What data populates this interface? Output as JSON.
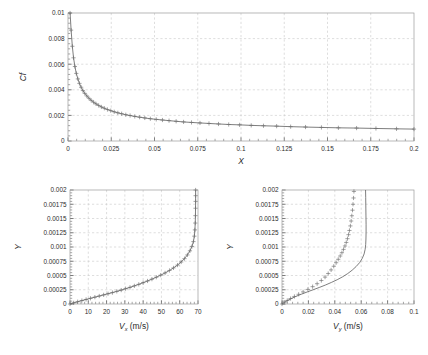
{
  "figure": {
    "name": "boundary-layer-results",
    "background": "#ffffff",
    "curve_color": "#5d5d5d",
    "grid_color": "#c8c8c8",
    "axis_color": "#9a9a9a"
  },
  "chart_data": [
    {
      "id": "cf-vs-x",
      "type": "line",
      "title": "",
      "xlabel": "X",
      "ylabel": "Cf",
      "xlim": [
        0,
        0.2
      ],
      "ylim": [
        0,
        0.01
      ],
      "grid": true,
      "legend": "none",
      "xticks": [
        0,
        0.025,
        0.05,
        0.075,
        0.1,
        0.125,
        0.15,
        0.175,
        0.2
      ],
      "xticklabels": [
        "0",
        "0.025",
        "0.05",
        "0.075",
        "0.1",
        "0.125",
        "0.15",
        "0.175",
        "0.2"
      ],
      "xminor_count": 5,
      "yticks": [
        0,
        0.002,
        0.004,
        0.006,
        0.008,
        0.01
      ],
      "yticklabels": [
        "0",
        "0.002",
        "0.004",
        "0.006",
        "0.008",
        "0.01"
      ],
      "yminor_count": 5,
      "series": [
        {
          "name": "Cf",
          "marker": "plus",
          "line": true,
          "x": [
            0.0012,
            0.0018,
            0.0025,
            0.0032,
            0.004,
            0.0048,
            0.0057,
            0.0066,
            0.0076,
            0.0086,
            0.0097,
            0.0109,
            0.0121,
            0.0134,
            0.0148,
            0.0162,
            0.0177,
            0.0193,
            0.021,
            0.0228,
            0.0247,
            0.0267,
            0.0288,
            0.031,
            0.0334,
            0.0359,
            0.0386,
            0.0414,
            0.0444,
            0.0476,
            0.051,
            0.0546,
            0.0584,
            0.0625,
            0.0668,
            0.0714,
            0.0763,
            0.0815,
            0.087,
            0.0929,
            0.0992,
            0.1059,
            0.113,
            0.1206,
            0.1287,
            0.1373,
            0.1465,
            0.1563,
            0.1668,
            0.178,
            0.1899,
            0.2
          ],
          "y": [
            0.01,
            0.00866,
            0.0074,
            0.0065,
            0.00582,
            0.00528,
            0.00485,
            0.0045,
            0.0042,
            0.00394,
            0.00372,
            0.00352,
            0.00334,
            0.00318,
            0.00303,
            0.0029,
            0.00278,
            0.00266,
            0.00256,
            0.00246,
            0.00237,
            0.00228,
            0.0022,
            0.00213,
            0.00205,
            0.00199,
            0.00192,
            0.00186,
            0.0018,
            0.00174,
            0.00169,
            0.00164,
            0.00159,
            0.00154,
            0.00149,
            0.00145,
            0.00141,
            0.00137,
            0.00133,
            0.00129,
            0.00126,
            0.00122,
            0.00119,
            0.00116,
            0.00112,
            0.00109,
            0.00106,
            0.00103,
            0.00101,
            0.00098,
            0.00095,
            0.00093
          ]
        }
      ]
    },
    {
      "id": "y-vs-vx",
      "type": "line",
      "title": "",
      "xlabel": "V",
      "xlabel_sub": "x",
      "xlabel_unit": " (m/s)",
      "ylabel": "Y",
      "xlim": [
        0,
        70
      ],
      "ylim": [
        0,
        0.002
      ],
      "grid": true,
      "legend": "none",
      "xticks": [
        0,
        10,
        20,
        30,
        40,
        50,
        60,
        70
      ],
      "xticklabels": [
        "0",
        "10",
        "20",
        "30",
        "40",
        "50",
        "60",
        "70"
      ],
      "xminor_count": 5,
      "yticks": [
        0,
        0.00025,
        0.0005,
        0.00075,
        0.001,
        0.00125,
        0.0015,
        0.00175,
        0.002
      ],
      "yticklabels": [
        "0",
        "0.00025",
        "0.0005",
        "0.00075",
        "0.001",
        "0.00125",
        "0.0015",
        "0.00175",
        "0.002"
      ],
      "yminor_count": 5,
      "series": [
        {
          "name": "Vx profile",
          "marker": "plus",
          "line": true,
          "x": [
            0.0,
            2.0,
            4.2,
            6.5,
            8.8,
            11.2,
            13.6,
            16.0,
            18.4,
            20.8,
            23.2,
            25.6,
            28.0,
            30.4,
            32.8,
            35.2,
            37.6,
            40.0,
            42.4,
            44.8,
            47.2,
            49.6,
            52.0,
            54.4,
            56.6,
            58.8,
            60.8,
            62.6,
            64.2,
            65.6,
            66.7,
            67.5,
            68.0,
            68.3,
            68.5,
            68.6,
            68.65,
            68.7,
            68.7,
            68.7
          ],
          "y": [
            0.0,
            2e-05,
            4e-05,
            6e-05,
            8e-05,
            0.0001,
            0.00012,
            0.00014,
            0.00016,
            0.00018,
            0.0002,
            0.000222,
            0.000244,
            0.000268,
            0.000292,
            0.000318,
            0.000345,
            0.000374,
            0.000404,
            0.000436,
            0.00047,
            0.000506,
            0.000545,
            0.000588,
            0.000633,
            0.000683,
            0.000737,
            0.000796,
            0.000861,
            0.000933,
            0.00101,
            0.001095,
            0.00119,
            0.0013,
            0.00142,
            0.00155,
            0.00168,
            0.0018,
            0.0019,
            0.002
          ]
        }
      ]
    },
    {
      "id": "y-vs-vy",
      "type": "line",
      "title": "",
      "xlabel": "V",
      "xlabel_sub": "y",
      "xlabel_unit": " (m/s)",
      "ylabel": "Y",
      "xlim": [
        0,
        0.1
      ],
      "ylim": [
        0,
        0.002
      ],
      "grid": true,
      "legend": "none",
      "xticks": [
        0,
        0.02,
        0.04,
        0.06,
        0.08,
        0.1
      ],
      "xticklabels": [
        "0",
        "0.02",
        "0.04",
        "0.06",
        "0.08",
        "0.1"
      ],
      "xminor_count": 5,
      "yticks": [
        0,
        0.00025,
        0.0005,
        0.00075,
        0.001,
        0.00125,
        0.0015,
        0.00175,
        0.002
      ],
      "yticklabels": [
        "0",
        "0.00025",
        "0.0005",
        "0.00075",
        "0.001",
        "0.00125",
        "0.0015",
        "0.00175",
        "0.002"
      ],
      "yminor_count": 5,
      "series": [
        {
          "name": "Vy analytic",
          "marker": "none",
          "line": true,
          "x": [
            0.0,
            0.0022,
            0.0048,
            0.0078,
            0.0112,
            0.015,
            0.0192,
            0.0236,
            0.0282,
            0.0328,
            0.0374,
            0.0418,
            0.046,
            0.0498,
            0.0532,
            0.0562,
            0.0588,
            0.0608,
            0.0622,
            0.063,
            0.0634,
            0.0636,
            0.0637,
            0.0637,
            0.0636,
            0.0635,
            0.0634,
            0.0633
          ],
          "y": [
            0.0,
            3.5e-05,
            7e-05,
            0.000105,
            0.00014,
            0.000175,
            0.000212,
            0.00025,
            0.00029,
            0.000332,
            0.000378,
            0.000426,
            0.000478,
            0.000534,
            0.000594,
            0.000658,
            0.000726,
            0.0008,
            0.000878,
            0.00096,
            0.001045,
            0.00114,
            0.00126,
            0.0014,
            0.00156,
            0.00172,
            0.00187,
            0.002
          ]
        },
        {
          "name": "Vy computed",
          "marker": "plus",
          "line": false,
          "x": [
            0.0,
            0.0018,
            0.004,
            0.0065,
            0.0094,
            0.0126,
            0.016,
            0.0196,
            0.0232,
            0.0266,
            0.0298,
            0.0326,
            0.035,
            0.0372,
            0.0392,
            0.041,
            0.0426,
            0.0441,
            0.0454,
            0.0466,
            0.0477,
            0.0487,
            0.0496,
            0.0504,
            0.0511,
            0.0518,
            0.0524,
            0.0529,
            0.0534,
            0.0538,
            0.0542,
            0.0545
          ],
          "y": [
            0.0,
            3e-05,
            6.2e-05,
            9.6e-05,
            0.000132,
            0.00017,
            0.000212,
            0.000256,
            0.000304,
            0.000356,
            0.000412,
            0.000472,
            0.000534,
            0.000598,
            0.000662,
            0.000724,
            0.000784,
            0.000842,
            0.0009,
            0.000958,
            0.001018,
            0.00108,
            0.001146,
            0.001216,
            0.00129,
            0.00137,
            0.001456,
            0.001548,
            0.001646,
            0.00175,
            0.00186,
            0.001975
          ]
        }
      ]
    }
  ]
}
